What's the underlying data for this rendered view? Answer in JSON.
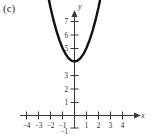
{
  "figure": {
    "panel_label": "(c)",
    "background_color": "#ffffff",
    "curve_color": "#111111",
    "axis_color": "#3a3a3a"
  },
  "chart_data": {
    "type": "line",
    "title": "",
    "subtitle": "",
    "xlabel": "x",
    "ylabel": "y",
    "xlim": [
      -4.6,
      4.6
    ],
    "ylim": [
      -1.4,
      7.9
    ],
    "grid": false,
    "legend": null,
    "x_ticks": [
      -4,
      -3,
      -2,
      -1,
      1,
      2,
      3,
      4
    ],
    "x_tick_labels": [
      "−4",
      "−3",
      "−2",
      "−1",
      "1",
      "2",
      "3",
      "4"
    ],
    "y_ticks": [
      -1,
      1,
      2,
      3,
      5,
      6,
      7
    ],
    "y_tick_labels": [
      "−1",
      "1",
      "2",
      "3",
      "5",
      "6",
      "7"
    ],
    "annotations": [],
    "series": [
      {
        "name": "parabola",
        "equation": "y = x^2 + 4",
        "vertex": [
          0,
          4
        ],
        "x": [
          -2.3,
          -2.0,
          -1.75,
          -1.5,
          -1.25,
          -1.0,
          -0.75,
          -0.5,
          -0.25,
          0,
          0.25,
          0.5,
          0.75,
          1.0,
          1.25,
          1.5,
          1.75,
          2.0,
          2.3
        ],
        "values": [
          9.29,
          8.0,
          7.06,
          6.25,
          5.56,
          5.0,
          4.56,
          4.25,
          4.06,
          4.0,
          4.06,
          4.25,
          4.56,
          5.0,
          5.56,
          6.25,
          7.06,
          8.0,
          9.29
        ]
      }
    ]
  }
}
